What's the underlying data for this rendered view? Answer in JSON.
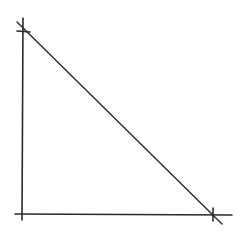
{
  "diagram": {
    "stroke_color": "#2a2a2a",
    "background": "#ffffff",
    "vertical_axis": {
      "x1": 23,
      "y1": 18,
      "x2": 22,
      "y2": 220
    },
    "horizontal_axis": {
      "x1": 15,
      "y1": 214,
      "x2": 232,
      "y2": 215
    },
    "diagonal_line": {
      "x1": 17,
      "y1": 22,
      "x2": 222,
      "y2": 224
    },
    "intercept_marks": [
      {
        "label": "y-intercept",
        "x": 23,
        "y": 31
      },
      {
        "label": "x-intercept",
        "x": 213,
        "y": 215
      }
    ]
  }
}
